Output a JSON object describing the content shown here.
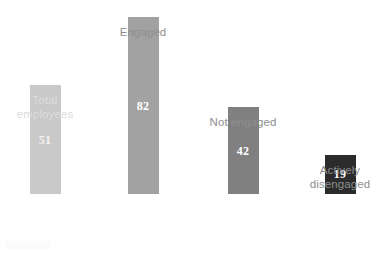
{
  "chart_data": {
    "type": "bar",
    "title": "",
    "subtitle": "",
    "xlabel": "",
    "ylabel": "",
    "ylim": [
      0,
      90
    ],
    "grid": false,
    "legend": "none",
    "categories": [
      "Total\nemployees",
      "Engaged",
      "Not engaged",
      "Actively\ndisengaged"
    ],
    "values": [
      51,
      82,
      42,
      19
    ],
    "value_labels": [
      "51",
      "82",
      "42",
      "19"
    ],
    "bar_colors": [
      "#c9c9c9",
      "#a2a2a2",
      "#808080",
      "#2b2b2b"
    ],
    "label_colors": [
      "#dcdcdc",
      "#8e8e8e",
      "#8e8e8e",
      "#8e8e8e"
    ],
    "value_label_color": "#ffffff",
    "background": "#ffffff",
    "bars": [
      {
        "category": "Total\nemployees",
        "value": 51,
        "label": "51",
        "color": "#c9c9c9"
      },
      {
        "category": "Engaged",
        "value": 82,
        "label": "82",
        "color": "#a2a2a2"
      },
      {
        "category": "Not engaged",
        "value": 42,
        "label": "42",
        "color": "#808080"
      },
      {
        "category": "Actively\ndisengaged",
        "value": 19,
        "label": "19",
        "color": "#2b2b2b"
      }
    ]
  }
}
